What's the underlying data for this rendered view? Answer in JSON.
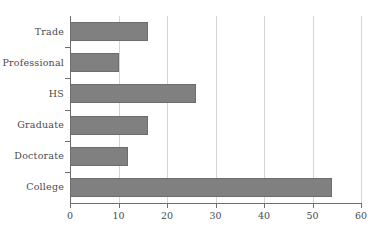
{
  "chart_data": {
    "type": "bar",
    "orientation": "horizontal",
    "title": "",
    "xlabel": "",
    "ylabel": "",
    "categories": [
      "Trade",
      "Professional",
      "HS",
      "Graduate",
      "Doctorate",
      "College"
    ],
    "values": [
      16,
      10,
      26,
      16,
      12,
      54
    ],
    "series": [
      {
        "name": "count",
        "values": [
          16,
          10,
          26,
          16,
          12,
          54
        ]
      }
    ],
    "xlim": [
      0,
      60
    ],
    "xticks": [
      0,
      10,
      20,
      30,
      40,
      50,
      60
    ],
    "xtick_labels": [
      "0",
      "10",
      "20",
      "30",
      "40",
      "50",
      "60"
    ],
    "grid": true,
    "grid_axis": "x",
    "legend": false,
    "legend_position": "none",
    "bar_color": "#808080",
    "bar_edge_color": "#6d6d6d",
    "gridline_color": "#d4d4d4",
    "axis_color": "#6e6e6e",
    "text_color": "#4a4a4a",
    "background_color": "#ffffff"
  }
}
